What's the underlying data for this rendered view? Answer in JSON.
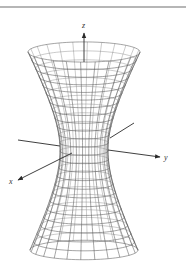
{
  "figure": {
    "surface": {
      "center_x": 84,
      "waist_y": 150,
      "waist_radius": 24,
      "top_y": 52,
      "top_radius": 56,
      "bottom_y": 250,
      "bottom_radius": 54,
      "ellipse_ratio": 0.18,
      "meridians": 24,
      "rings": 25,
      "line_color": "#5a5a5a"
    },
    "axes": {
      "z": {
        "label": "z",
        "from": [
          84,
          62
        ],
        "to": [
          84,
          33
        ],
        "label_pos": [
          82,
          28
        ]
      },
      "x": {
        "label": "x",
        "back_from": [
          134,
          123
        ],
        "back_to": [
          110,
          138
        ],
        "from": [
          72,
          153
        ],
        "to": [
          18,
          180
        ],
        "label_pos": [
          9,
          184
        ]
      },
      "y": {
        "label": "y",
        "back_from": [
          18,
          140
        ],
        "back_to": [
          60,
          146
        ],
        "from": [
          108,
          150
        ],
        "to": [
          160,
          157
        ],
        "label_pos": [
          164,
          160
        ]
      }
    },
    "top_rule": {
      "y": 7,
      "x1": 0,
      "x2": 186,
      "color": "#6e6e6e"
    }
  }
}
